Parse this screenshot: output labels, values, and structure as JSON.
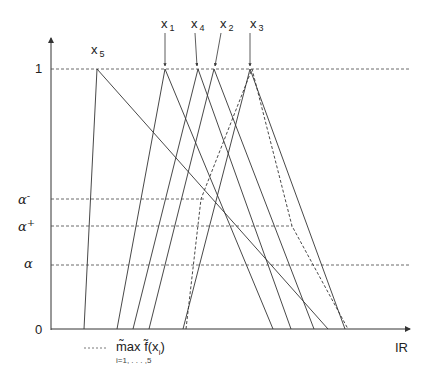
{
  "diagram": {
    "axes": {
      "y_axis_label_top": "1",
      "y_axis_label_bottom": "0",
      "x_axis_label": "IR"
    },
    "levels": [
      {
        "id": "one",
        "label": "1",
        "y": 69
      },
      {
        "id": "alpha_minus",
        "label": "α",
        "sup": "-",
        "y": 199
      },
      {
        "id": "alpha_plus",
        "label": "α",
        "sup": "+",
        "y": 226
      },
      {
        "id": "alpha",
        "label": "α",
        "sup": "",
        "y": 265
      }
    ],
    "fuzzy_numbers": [
      {
        "name": "x",
        "index": "5",
        "left": 84,
        "peak": 97,
        "right": 328
      },
      {
        "name": "x",
        "index": "1",
        "left": 117,
        "peak": 165,
        "right": 273
      },
      {
        "name": "x",
        "index": "4",
        "left": 133,
        "peak": 198,
        "right": 291
      },
      {
        "name": "x",
        "index": "2",
        "left": 149,
        "peak": 214,
        "right": 314
      },
      {
        "name": "x",
        "index": "3",
        "left": 183,
        "peak": 250,
        "right": 345
      }
    ],
    "legend": {
      "line_style": "dashed",
      "label": "m̃ax  f̃(x",
      "label_sub": "i",
      "label_close": ")",
      "range": "i=1, . . . ,5"
    }
  }
}
